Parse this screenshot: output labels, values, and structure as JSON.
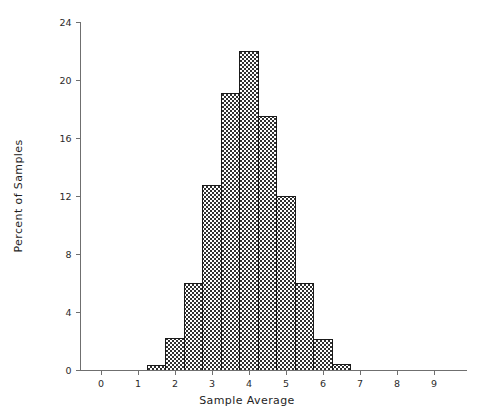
{
  "chart_data": {
    "type": "bar",
    "title": "",
    "subtitle": "",
    "xlabel": "Sample Average",
    "ylabel": "Percent of Samples",
    "xlim": [
      -0.6,
      9.9
    ],
    "ylim": [
      0,
      24
    ],
    "grid": false,
    "legend": null,
    "bin_width": 0.5,
    "x_ticks": [
      0,
      1,
      2,
      3,
      4,
      5,
      6,
      7,
      8,
      9
    ],
    "x_tick_labels": [
      "0",
      "1",
      "2",
      "3",
      "4",
      "5",
      "6",
      "7",
      "8",
      "9"
    ],
    "y_ticks": [
      0,
      4,
      8,
      12,
      16,
      20,
      24
    ],
    "y_tick_labels": [
      "0",
      "4",
      "8",
      "12",
      "16",
      "20",
      "24"
    ],
    "bins": [
      {
        "left": 1.25,
        "right": 1.75,
        "center": 1.5,
        "value": 0.3
      },
      {
        "left": 1.75,
        "right": 2.25,
        "center": 2.0,
        "value": 2.2
      },
      {
        "left": 2.25,
        "right": 2.75,
        "center": 2.5,
        "value": 6.0
      },
      {
        "left": 2.75,
        "right": 3.25,
        "center": 3.0,
        "value": 12.7
      },
      {
        "left": 3.25,
        "right": 3.75,
        "center": 3.5,
        "value": 19.1
      },
      {
        "left": 3.75,
        "right": 4.25,
        "center": 4.0,
        "value": 22.0
      },
      {
        "left": 4.25,
        "right": 4.75,
        "center": 4.5,
        "value": 17.5
      },
      {
        "left": 4.75,
        "right": 5.25,
        "center": 5.0,
        "value": 12.0
      },
      {
        "left": 5.25,
        "right": 5.75,
        "center": 5.5,
        "value": 6.0
      },
      {
        "left": 5.75,
        "right": 6.25,
        "center": 6.0,
        "value": 2.1
      },
      {
        "left": 6.25,
        "right": 6.75,
        "center": 6.5,
        "value": 0.4
      }
    ],
    "categories": [
      "1.5",
      "2.0",
      "2.5",
      "3.0",
      "3.5",
      "4.0",
      "4.5",
      "5.0",
      "5.5",
      "6.0",
      "6.5"
    ],
    "values": [
      0.3,
      2.2,
      6.0,
      12.7,
      19.1,
      22.0,
      17.5,
      12.0,
      6.0,
      2.1,
      0.4
    ],
    "bar_fill_description": "checkerboard-hatch",
    "colors": {
      "bar_fill": "#808080",
      "bar_edge": "#1a1a1a",
      "axis": "#6f6f6f",
      "text": "#2b2b2b",
      "background": "#ffffff"
    }
  }
}
